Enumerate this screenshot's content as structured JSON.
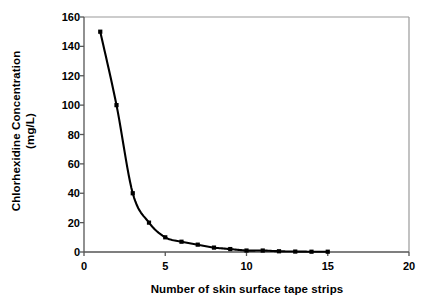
{
  "chart_data": {
    "type": "line",
    "title": "",
    "xlabel": "Number of skin surface tape strips",
    "ylabel": "Chlorhexidine Concentration (mg/L)",
    "ylabel_line1": "Chlorhexidine Concentration",
    "ylabel_line2": "(mg/L)",
    "xlim": [
      0,
      20
    ],
    "ylim": [
      0,
      160
    ],
    "xticks": [
      0,
      5,
      10,
      15,
      20
    ],
    "xtick_labels": [
      "0",
      "5",
      "10",
      "15",
      "20"
    ],
    "yticks": [
      0,
      20,
      40,
      60,
      80,
      100,
      120,
      140,
      160
    ],
    "ytick_labels": [
      "0",
      "20",
      "40",
      "60",
      "80",
      "100",
      "120",
      "140",
      "160"
    ],
    "grid": false,
    "legend": false,
    "marker": "square",
    "line_color": "#000000",
    "marker_color": "#000000",
    "axis_color": "#808080",
    "x": [
      1,
      2,
      3,
      4,
      5,
      6,
      7,
      8,
      9,
      10,
      11,
      12,
      13,
      14,
      15
    ],
    "values": [
      150,
      100,
      40,
      20,
      10,
      7,
      5,
      3,
      2,
      1,
      1,
      0.5,
      0.3,
      0.2,
      0.2
    ],
    "series": [
      {
        "name": "Chlorhexidine concentration",
        "values": [
          150,
          100,
          40,
          20,
          10,
          7,
          5,
          3,
          2,
          1,
          1,
          0.5,
          0.3,
          0.2,
          0.2
        ]
      }
    ]
  }
}
